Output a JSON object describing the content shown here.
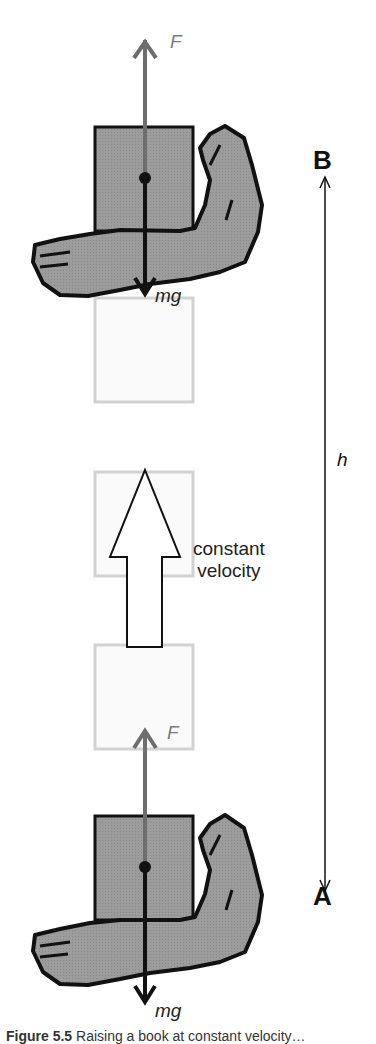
{
  "figure": {
    "labels": {
      "force_top": "F",
      "weight_top": "mg",
      "force_bottom": "F",
      "weight_bottom": "mg",
      "point_top": "B",
      "point_bottom": "A",
      "height": "h",
      "motion_line1": "constant",
      "motion_line2": "velocity"
    },
    "caption": {
      "number": "Figure 5.5",
      "text": "Raising a book at constant velocity…"
    },
    "colors": {
      "block_fill": "#9a9a9a",
      "hand_fill": "#8e8e8e",
      "outline": "#111111",
      "force_arrow": "#6e6e6e",
      "ghost_block": "#d4d4d4",
      "ghost_fill": "#fafafa"
    },
    "elements": [
      {
        "name": "book-top",
        "state": "B"
      },
      {
        "name": "ghost-block-1"
      },
      {
        "name": "ghost-block-2"
      },
      {
        "name": "ghost-block-3"
      },
      {
        "name": "book-bottom",
        "state": "A"
      }
    ]
  }
}
